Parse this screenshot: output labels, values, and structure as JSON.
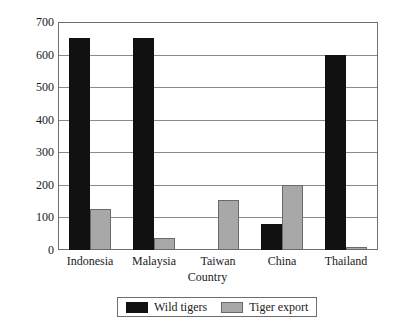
{
  "chart_data": {
    "type": "bar",
    "title": "",
    "xlabel": "Country",
    "ylabel": "Tiger numbers",
    "categories": [
      "Indonesia",
      "Malaysia",
      "Taiwan",
      "China",
      "Thailand"
    ],
    "series": [
      {
        "name": "Wild tigers",
        "color": "#111111",
        "values": [
          650,
          650,
          0,
          80,
          600
        ]
      },
      {
        "name": "Tiger export",
        "color": "#a8a8a8",
        "values": [
          125,
          38,
          155,
          200,
          8
        ]
      }
    ],
    "ylim": [
      0,
      700
    ],
    "yticks": [
      0,
      100,
      200,
      300,
      400,
      500,
      600,
      700
    ],
    "ytick_labels": [
      "0",
      "100",
      "200",
      "300",
      "400",
      "500",
      "600",
      "700"
    ],
    "grid": true,
    "grid_axis": "y",
    "legend_position": "bottom",
    "legend_entries": [
      "Wild tigers",
      "Tiger export"
    ]
  },
  "colors": {
    "wild_tigers": "#111111",
    "tiger_export": "#a8a8a8",
    "axis": "#6e6e6e",
    "gridline": "#8a8a8a",
    "background": "#ffffff"
  }
}
